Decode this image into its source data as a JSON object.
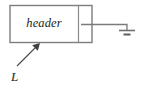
{
  "figure": {
    "background_color": "#ffffff",
    "line_color": "#7d7d7d",
    "text_color": "#1c1c1c"
  },
  "block": {
    "header_cell": {
      "label": "header",
      "style": "italic"
    },
    "payload_cell": {
      "label": ""
    }
  },
  "ground": {
    "symbol_name": "ground-symbol",
    "bars": 2
  },
  "callout": {
    "label": "L",
    "points_to": "header"
  }
}
